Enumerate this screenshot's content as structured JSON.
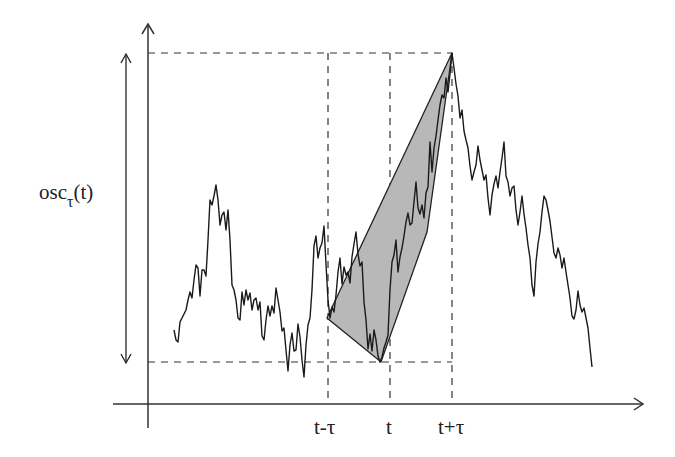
{
  "diagram": {
    "title": "",
    "y_label": {
      "main": "osc",
      "subscript": "τ",
      "suffix": "(t)"
    },
    "x_ticks": [
      {
        "label": "t-τ",
        "x": 328
      },
      {
        "label": "t",
        "x": 390
      },
      {
        "label": "t+τ",
        "x": 452
      }
    ],
    "colors": {
      "line": "#1a1a1a",
      "fill": "#b8b8b8",
      "dash": "#333333"
    }
  }
}
